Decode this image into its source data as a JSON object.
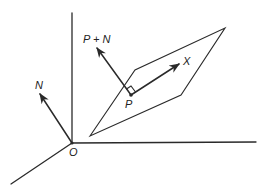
{
  "diagram": {
    "type": "vector-plane-diagram",
    "colors": {
      "stroke": "#2a2a2a",
      "background": "#ffffff"
    },
    "axes": {
      "origin": [
        72,
        143
      ],
      "vertical_end": [
        72,
        13
      ],
      "horizontal_end": [
        256,
        142
      ],
      "diagonal_end": [
        11,
        184
      ]
    },
    "plane": {
      "vertices": [
        [
          90,
          136
        ],
        [
          135,
          70
        ],
        [
          225,
          28
        ],
        [
          181,
          95
        ]
      ]
    },
    "vectors": [
      {
        "id": "N",
        "from": [
          72,
          143
        ],
        "to": [
          39,
          93
        ]
      },
      {
        "id": "P+N",
        "from": [
          131,
          95
        ],
        "to": [
          96,
          47
        ]
      },
      {
        "id": "X",
        "from": [
          131,
          95
        ],
        "to": [
          180,
          63
        ]
      }
    ],
    "points": [
      {
        "id": "P",
        "at": [
          131,
          95
        ]
      },
      {
        "id": "O",
        "at": [
          72,
          143
        ]
      }
    ]
  },
  "labels": {
    "origin": "O",
    "normal": "N",
    "point": "P",
    "p_plus_n": "P + N",
    "x": "X"
  }
}
